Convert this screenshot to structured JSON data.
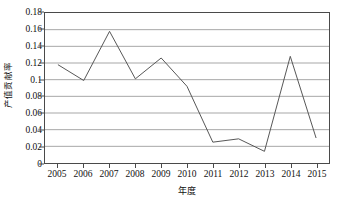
{
  "chart_data": {
    "type": "line",
    "title": "",
    "subtitle": "",
    "xlabel": "年度",
    "ylabel": "产值贡献率",
    "categories": [
      "2005",
      "2006",
      "2007",
      "2008",
      "2009",
      "2010",
      "2011",
      "2012",
      "2013",
      "2014",
      "2015"
    ],
    "x": [
      2005,
      2006,
      2007,
      2008,
      2009,
      2010,
      2011,
      2012,
      2013,
      2014,
      2015
    ],
    "values": [
      0.118,
      0.099,
      0.158,
      0.101,
      0.126,
      0.092,
      0.025,
      0.029,
      0.014,
      0.128,
      0.03
    ],
    "series": [
      {
        "name": "产值贡献率",
        "values": [
          0.118,
          0.099,
          0.158,
          0.101,
          0.126,
          0.092,
          0.025,
          0.029,
          0.014,
          0.128,
          0.03
        ]
      }
    ],
    "ylim": [
      0,
      0.18
    ],
    "yticks": [
      0,
      0.02,
      0.04,
      0.06,
      0.08,
      0.1,
      0.12,
      0.14,
      0.16,
      0.18
    ],
    "ytick_labels": [
      "0",
      "0.02",
      "0.04",
      "0.06",
      "0.08",
      "0.1",
      "0.12",
      "0.14",
      "0.16",
      "0.18"
    ],
    "xtick_labels": [
      "2005",
      "2006",
      "2007",
      "2008",
      "2009",
      "2010",
      "2011",
      "2012",
      "2013",
      "2014",
      "2015"
    ],
    "grid": "horizontal",
    "legend": "none",
    "markers": "none",
    "line_color": "#555555",
    "grid_color": "#a6a6a6",
    "axis_color": "#4a4a4a",
    "background_color": "#ffffff"
  }
}
